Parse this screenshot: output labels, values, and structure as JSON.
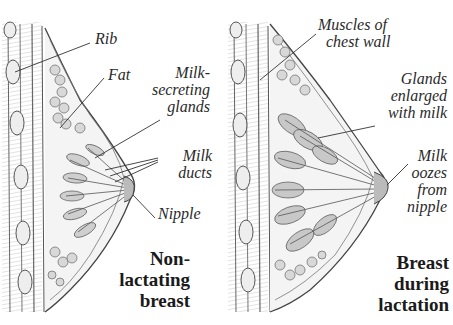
{
  "diagram": {
    "panels": [
      {
        "caption": [
          "Non-",
          "lactating",
          "breast"
        ],
        "labels": {
          "rib": "Rib",
          "fat": "Fat",
          "glands": [
            "Milk-",
            "secreting",
            "glands"
          ],
          "ducts": [
            "Milk",
            "ducts"
          ],
          "nipple": "Nipple"
        }
      },
      {
        "caption": [
          "Breast",
          "during",
          "lactation"
        ],
        "labels": {
          "muscles": [
            "Muscles of",
            "chest wall"
          ],
          "glands_enlarged": [
            "Glands",
            "enlarged",
            "with milk"
          ],
          "milk_oozes": [
            "Milk",
            "oozes",
            "from",
            "nipple"
          ]
        }
      }
    ]
  }
}
